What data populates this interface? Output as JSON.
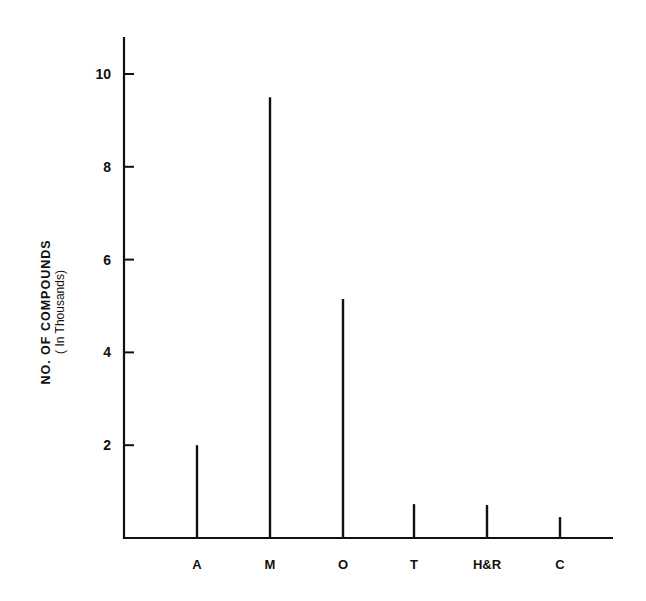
{
  "chart_data": {
    "type": "bar",
    "title": "",
    "xlabel": "",
    "ylabel": "NO. OF COMPOUNDS",
    "ylabel_sub": "( In Thousands)",
    "categories": [
      "A",
      "M",
      "O",
      "T",
      "H&R",
      "C"
    ],
    "values": [
      2.0,
      9.5,
      5.15,
      0.73,
      0.71,
      0.45
    ],
    "yticks": [
      2,
      4,
      6,
      8,
      10
    ],
    "ylim": [
      0,
      10.8
    ],
    "grid": false,
    "legend": null,
    "bar_style": "thin vertical lines"
  },
  "colors": {
    "ink": "#111111",
    "background": "#ffffff"
  }
}
